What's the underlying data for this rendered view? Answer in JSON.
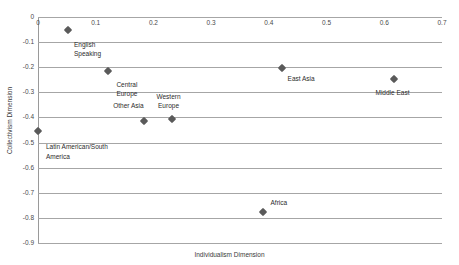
{
  "chart_data": {
    "type": "scatter",
    "title": "",
    "xlabel": "Individualism Dimension",
    "ylabel": "Collectivism Dimension",
    "xlim": [
      0,
      0.7
    ],
    "ylim": [
      -0.9,
      0
    ],
    "xticks": [
      "0",
      "0.1",
      "0.2",
      "0.3",
      "0.4",
      "0.5",
      "0.6",
      "0.7"
    ],
    "xtick_values": [
      0,
      0.1,
      0.2,
      0.3,
      0.4,
      0.5,
      0.6,
      0.7
    ],
    "yticks": [
      "0",
      "-0.1",
      "-0.2",
      "-0.3",
      "-0.4",
      "-0.5",
      "-0.6",
      "-0.7",
      "-0.8",
      "-0.9"
    ],
    "ytick_values": [
      0,
      -0.1,
      -0.2,
      -0.3,
      -0.4,
      -0.5,
      -0.6,
      -0.7,
      -0.8,
      -0.9
    ],
    "grid": true,
    "legend": "none",
    "marker_color": "#5a5a5a",
    "gridline_color": "#a6a6a6",
    "points": [
      {
        "label": "English\nSpeaking",
        "x": 0.052,
        "y": -0.052,
        "label_dx": 6,
        "label_dy": 10,
        "label_align": "left"
      },
      {
        "label": "Central\nEurope",
        "x": 0.122,
        "y": -0.215,
        "label_dx": 8,
        "label_dy": 9,
        "label_align": "left"
      },
      {
        "label": "Other Asia",
        "x": 0.184,
        "y": -0.414,
        "label_dx": -31,
        "label_dy": -20,
        "label_align": "left"
      },
      {
        "label": "Western\nEurope",
        "x": 0.233,
        "y": -0.406,
        "label_dx": -16,
        "label_dy": -27,
        "label_align": "center"
      },
      {
        "label": "East Asia",
        "x": 0.422,
        "y": -0.205,
        "label_dx": 6,
        "label_dy": 6,
        "label_align": "left"
      },
      {
        "label": "Middle East",
        "x": 0.616,
        "y": -0.247,
        "label_dx": -18,
        "label_dy": 9,
        "label_align": "left"
      },
      {
        "label": "Latin American/South\nAmerica",
        "x": 0.0,
        "y": -0.455,
        "label_dx": 8,
        "label_dy": 11,
        "label_align": "left"
      },
      {
        "label": "Africa",
        "x": 0.389,
        "y": -0.777,
        "label_dx": 8,
        "label_dy": -14,
        "label_align": "left"
      }
    ]
  }
}
